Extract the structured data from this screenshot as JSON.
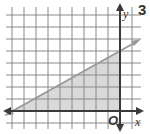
{
  "problem_number": "3",
  "axes": {
    "x_label": "x",
    "y_label": "y",
    "origin_label": "O"
  },
  "graph": {
    "grid_unit_px": 12,
    "origin_px": [
      120,
      111
    ],
    "x_range": [
      -9,
      1
    ],
    "y_range": [
      -1,
      8
    ],
    "line": {
      "equation": "y = (5/9)x + 5",
      "slope": "5/9",
      "y_intercept": 5,
      "x_intercept": -9
    },
    "shaded_region": {
      "shape": "triangle",
      "vertices": [
        [
          -9,
          0
        ],
        [
          0,
          0
        ],
        [
          0,
          5
        ]
      ]
    }
  },
  "colors": {
    "grid": "#8a8a8a",
    "axis": "#3a3a3a",
    "line": "#9a9a9a",
    "shading": "#d9d9d9"
  }
}
